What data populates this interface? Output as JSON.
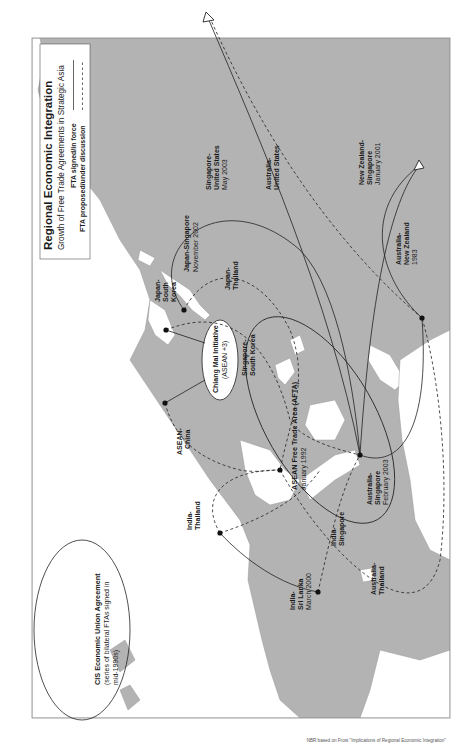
{
  "legend": {
    "title": "Regional Economic Integration",
    "subtitle": "Growth of Free Trade Agreements in Strategic Asia",
    "signed_label": "FTA signed/in force",
    "proposed_label": "FTA proposed/under discussion",
    "signed_style": "solid",
    "proposed_style": "dashed"
  },
  "colors": {
    "sea": "#b3b3b3",
    "land": "#ffffff",
    "line": "#222222",
    "frame": "#888888"
  },
  "agreements": {
    "cis": {
      "name": "CIS Economic Union Agreement",
      "line2": "(series of bilateral FTAs signed in",
      "line3": "mid-1990s)"
    },
    "chiang_mai": {
      "name": "Chiang Mai Initiative",
      "line2": "(ASEAN +3)"
    },
    "afta": {
      "name": "ASEAN Free Trade Area (AFTA)",
      "date": "January 1992"
    },
    "japan_skorea": {
      "line1": "Japan-",
      "line2": "South",
      "line3": "Korea"
    },
    "japan_singapore": {
      "name": "Japan-Singapore",
      "date": "November 2002"
    },
    "japan_thailand": {
      "line1": "Japan-",
      "line2": "Thailand"
    },
    "singapore_skorea": {
      "line1": "Singapore-",
      "line2": "South Korea"
    },
    "singapore_us": {
      "line1": "Singapore-",
      "line2": "United States",
      "date": "May 2003"
    },
    "australia_us": {
      "line1": "Australia-",
      "line2": "United States"
    },
    "nz_singapore": {
      "line1": "New Zealand-",
      "line2": "Singapore",
      "date": "January 2001"
    },
    "australia_nz": {
      "line1": "Australia-",
      "line2": "New Zealand",
      "date": "1983"
    },
    "asean_china": {
      "line1": "ASEAN-",
      "line2": "China"
    },
    "india_thailand": {
      "line1": "India-",
      "line2": "Thailand"
    },
    "india_srilanka": {
      "line1": "India-",
      "line2": "Sri Lanka",
      "date": "March 2000"
    },
    "india_singapore": {
      "line1": "India-",
      "line2": "Singapore"
    },
    "australia_singapore": {
      "line1": "Australia-",
      "line2": "Singapore",
      "date": "February 2003"
    },
    "australia_thailand": {
      "line1": "Australia-",
      "line2": "Thailand"
    }
  },
  "credit": "NBR based on Frost \"Implications of Regional Economic Integration\""
}
